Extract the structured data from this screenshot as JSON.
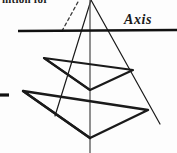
{
  "figure": {
    "kind": "geometry-diagram",
    "caption_fragment": "nition for",
    "axis_label": "Axis",
    "background_color": "#fdfdfd",
    "ink_color": "#1a1a1a",
    "canvas": {
      "width": 177,
      "height": 153
    },
    "elements": {
      "axis_line": {
        "name": "horizontal-axis-line",
        "x1": 18,
        "y1": 31,
        "x2": 177,
        "y2": 30,
        "stroke_width": 2.6
      },
      "vertical_axis_line": {
        "name": "vertical-center-line",
        "x1": 90,
        "y1": 0,
        "x2": 90,
        "y2": 153,
        "stroke_width": 1.3
      },
      "left_tick": {
        "name": "left-margin-tick",
        "x1": 0,
        "y1": 95,
        "x2": 9,
        "y2": 95,
        "stroke_width": 3.2
      },
      "cone_left_edge": {
        "name": "cone-left-generator",
        "x1": 91,
        "y1": 0,
        "x2": 55,
        "y2": 116,
        "stroke_width": 1.2
      },
      "cone_right_edge": {
        "name": "cone-right-generator",
        "x1": 91,
        "y1": 0,
        "x2": 160,
        "y2": 124,
        "stroke_width": 1.2
      },
      "dashed_construction": {
        "name": "dashed-construction-line",
        "x1": 62,
        "y1": 31,
        "x2": 79,
        "y2": 0,
        "stroke_width": 1.3,
        "dash": "3 3"
      },
      "upper_section": {
        "name": "upper-conic-section",
        "points": "44,58 133,70 90,90",
        "stroke_width": 2.2
      },
      "lower_section": {
        "name": "lower-conic-section",
        "points": "23,91 148,110 90,138",
        "stroke_width": 2.4
      },
      "upper_left_chord": {
        "name": "upper-left-chord",
        "x1": 44,
        "y1": 58,
        "x2": 90,
        "y2": 90,
        "stroke_width": 2.0
      },
      "lower_left_chord": {
        "name": "lower-left-chord",
        "x1": 23,
        "y1": 91,
        "x2": 90,
        "y2": 138,
        "stroke_width": 2.2
      }
    }
  }
}
